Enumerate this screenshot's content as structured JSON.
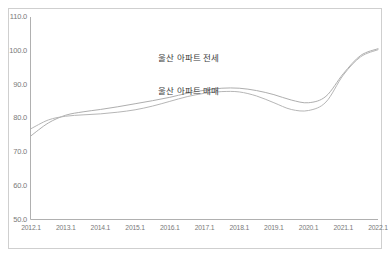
{
  "chart_data": {
    "type": "line",
    "title": "",
    "subtitle": "",
    "xlabel": "",
    "ylabel": "",
    "ylim": [
      50.0,
      110.0
    ],
    "yticks": [
      "50.0",
      "60.0",
      "70.0",
      "80.0",
      "90.0",
      "100.0",
      "110.0"
    ],
    "ytick_values": [
      50.0,
      60.0,
      70.0,
      80.0,
      90.0,
      100.0,
      110.0
    ],
    "grid": false,
    "legend_position": "inline-annotation",
    "xtick_labels": [
      "2012.1",
      "2013.1",
      "2014.1",
      "2015.1",
      "2016.1",
      "2017.1",
      "2018.1",
      "2019.1",
      "2020.1",
      "2021.1",
      "2022.1"
    ],
    "x": [
      2012.0,
      2012.5,
      2013.0,
      2013.5,
      2014.0,
      2014.5,
      2015.0,
      2015.5,
      2016.0,
      2016.5,
      2017.0,
      2017.5,
      2018.0,
      2018.5,
      2019.0,
      2019.5,
      2020.0,
      2020.5,
      2021.0,
      2021.5,
      2022.0
    ],
    "series": [
      {
        "name": "울산 아파트 전세",
        "color": "#aeaeae",
        "values": [
          74.8,
          78.6,
          80.9,
          81.9,
          82.6,
          83.4,
          84.3,
          85.2,
          86.2,
          87.4,
          88.3,
          88.9,
          88.9,
          88.2,
          87.0,
          85.4,
          84.6,
          86.5,
          93.2,
          98.6,
          100.6
        ]
      },
      {
        "name": "울산 아파트 매매",
        "color": "#b6b6b6",
        "values": [
          76.9,
          79.5,
          80.6,
          81.0,
          81.3,
          81.8,
          82.5,
          83.6,
          85.0,
          86.4,
          87.4,
          87.9,
          87.8,
          86.6,
          84.6,
          82.6,
          82.3,
          84.8,
          92.8,
          98.2,
          100.3
        ]
      }
    ],
    "annotations": [
      {
        "text": "울산 아파트 전세",
        "x_px": 158,
        "y_px": 56
      },
      {
        "text": "울산 아파트 매매",
        "x_px": 158,
        "y_px": 89
      }
    ]
  },
  "colors": {
    "frame": "#cfcfcf",
    "axis": "#b0b0b0",
    "tick_text": "#7a7a7a",
    "label_text": "#3c3c3c",
    "background": "#ffffff"
  }
}
